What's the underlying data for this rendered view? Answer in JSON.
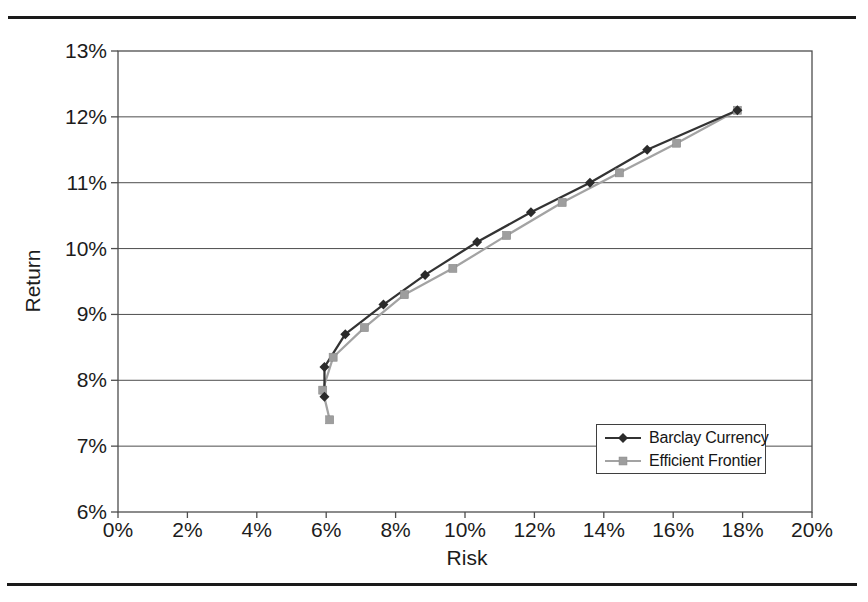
{
  "accent_colors": {
    "rule": "#1a1a1a",
    "grid": "#4d4d4d",
    "text": "#1c1c1c",
    "background": "#ffffff"
  },
  "chart_data": {
    "type": "line",
    "xlabel": "Risk",
    "ylabel": "Return",
    "xlim": [
      0,
      20
    ],
    "ylim": [
      6,
      13
    ],
    "x_ticks": [
      "0%",
      "2%",
      "4%",
      "6%",
      "8%",
      "10%",
      "12%",
      "14%",
      "16%",
      "18%",
      "20%"
    ],
    "y_ticks": [
      "13%",
      "12%",
      "11%",
      "10%",
      "9%",
      "8%",
      "7%",
      "6%"
    ],
    "grid": "horizontal",
    "legend_position": "inside-lower-right",
    "series": [
      {
        "name": "Barclay Currency",
        "marker": "diamond",
        "color": "#333333",
        "marker_color": "#2b2b2b",
        "points": [
          [
            5.95,
            7.75
          ],
          [
            5.95,
            8.2
          ],
          [
            6.55,
            8.7
          ],
          [
            7.65,
            9.15
          ],
          [
            8.85,
            9.6
          ],
          [
            10.35,
            10.1
          ],
          [
            11.9,
            10.55
          ],
          [
            13.6,
            11.0
          ],
          [
            15.25,
            11.5
          ],
          [
            17.85,
            12.1
          ]
        ]
      },
      {
        "name": "Efficient Frontier",
        "marker": "square",
        "color": "#a3a3a3",
        "marker_color": "#9e9e9e",
        "points": [
          [
            6.1,
            7.4
          ],
          [
            5.9,
            7.85
          ],
          [
            6.2,
            8.35
          ],
          [
            7.1,
            8.8
          ],
          [
            8.25,
            9.3
          ],
          [
            9.65,
            9.7
          ],
          [
            11.2,
            10.2
          ],
          [
            12.8,
            10.7
          ],
          [
            14.45,
            11.15
          ],
          [
            16.1,
            11.6
          ],
          [
            17.85,
            12.1
          ]
        ]
      }
    ]
  }
}
